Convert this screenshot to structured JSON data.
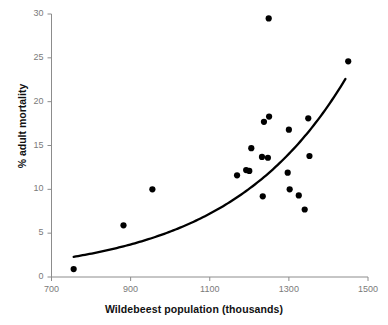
{
  "chart_data": {
    "type": "scatter",
    "title": "",
    "xlabel": "Wildebeest population (thousands)",
    "ylabel": "% adult mortality",
    "xlim": [
      700,
      1500
    ],
    "ylim": [
      0,
      30
    ],
    "xticks": [
      700,
      900,
      1100,
      1300,
      1500
    ],
    "yticks": [
      0,
      5,
      10,
      15,
      20,
      25,
      30
    ],
    "grid": false,
    "legend": null,
    "series": [
      {
        "name": "observations",
        "marker": "filled-circle",
        "color": "#000000",
        "points": [
          {
            "x": 756,
            "y": 0.9
          },
          {
            "x": 882,
            "y": 5.9
          },
          {
            "x": 955,
            "y": 10.0
          },
          {
            "x": 1169,
            "y": 11.6
          },
          {
            "x": 1192,
            "y": 12.2
          },
          {
            "x": 1200,
            "y": 12.1
          },
          {
            "x": 1205,
            "y": 14.7
          },
          {
            "x": 1232,
            "y": 13.7
          },
          {
            "x": 1247,
            "y": 13.6
          },
          {
            "x": 1234,
            "y": 9.2
          },
          {
            "x": 1237,
            "y": 17.7
          },
          {
            "x": 1250,
            "y": 18.3
          },
          {
            "x": 1249,
            "y": 29.5
          },
          {
            "x": 1300,
            "y": 16.8
          },
          {
            "x": 1297,
            "y": 11.9
          },
          {
            "x": 1302,
            "y": 10.0
          },
          {
            "x": 1325,
            "y": 9.3
          },
          {
            "x": 1340,
            "y": 7.7
          },
          {
            "x": 1349,
            "y": 18.1
          },
          {
            "x": 1352,
            "y": 13.8
          },
          {
            "x": 1450,
            "y": 24.6
          }
        ]
      }
    ],
    "fit_curve": {
      "name": "exponential-trend-line",
      "color": "#000000",
      "x_start": 756,
      "x_end": 1443,
      "y_start": 2.3,
      "y_end": 22.6,
      "description": "smooth increasing exponential fit"
    }
  },
  "axes": {
    "axis_color": "#8c8c8c",
    "tick_color": "#7a7a7a",
    "label_color": "#111111"
  }
}
